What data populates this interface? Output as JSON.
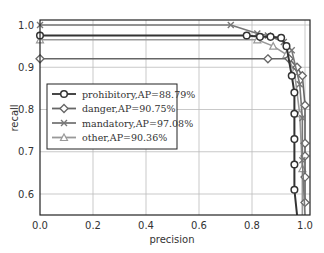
{
  "chart_data": {
    "type": "line",
    "title": "",
    "xlabel": "precision",
    "ylabel": "recall",
    "xlim": [
      0.0,
      1.0
    ],
    "ylim": [
      0.55,
      1.0
    ],
    "xticks": [
      "0.0",
      "0.2",
      "0.4",
      "0.6",
      "0.8",
      "1.0"
    ],
    "yticks": [
      "0.6",
      "0.7",
      "0.8",
      "0.9",
      "1.0"
    ],
    "grid": true,
    "legend_position": "center-left",
    "series": [
      {
        "name": "prohibitory, AP=88.79%",
        "label": "prohibitory,AP=88.79%",
        "marker": "circle",
        "color": "#333333",
        "x": [
          0.0,
          0.78,
          0.83,
          0.87,
          0.91,
          0.93,
          0.95,
          0.96,
          0.96,
          0.96,
          0.96,
          0.96,
          0.97
        ],
        "y": [
          0.975,
          0.975,
          0.972,
          0.972,
          0.97,
          0.95,
          0.88,
          0.84,
          0.79,
          0.73,
          0.67,
          0.61,
          0.55
        ]
      },
      {
        "name": "danger, AP=90.75%",
        "label": "danger,AP=90.75%",
        "marker": "diamond",
        "color": "#666666",
        "x": [
          0.0,
          0.86,
          0.94,
          0.97,
          0.99,
          1.0,
          1.0,
          1.0,
          1.0,
          1.0
        ],
        "y": [
          0.92,
          0.92,
          0.92,
          0.9,
          0.88,
          0.81,
          0.72,
          0.69,
          0.64,
          0.58
        ]
      },
      {
        "name": "mandatory, AP=97.08%",
        "label": "mandatory,AP=97.08%",
        "marker": "x",
        "color": "#777777",
        "x": [
          0.0,
          0.72,
          0.82,
          0.86,
          0.92,
          0.95,
          0.98,
          0.99,
          0.99,
          1.0
        ],
        "y": [
          1.0,
          1.0,
          0.98,
          0.975,
          0.96,
          0.94,
          0.86,
          0.78,
          0.68,
          0.55
        ]
      },
      {
        "name": "other, AP=90.36%",
        "label": "other,AP=90.36%",
        "marker": "triangle",
        "color": "#999999",
        "x": [
          0.0,
          0.82,
          0.88,
          0.93,
          0.96,
          0.98,
          0.99,
          0.99
        ],
        "y": [
          0.965,
          0.965,
          0.95,
          0.93,
          0.89,
          0.79,
          0.66,
          0.55
        ]
      }
    ]
  }
}
